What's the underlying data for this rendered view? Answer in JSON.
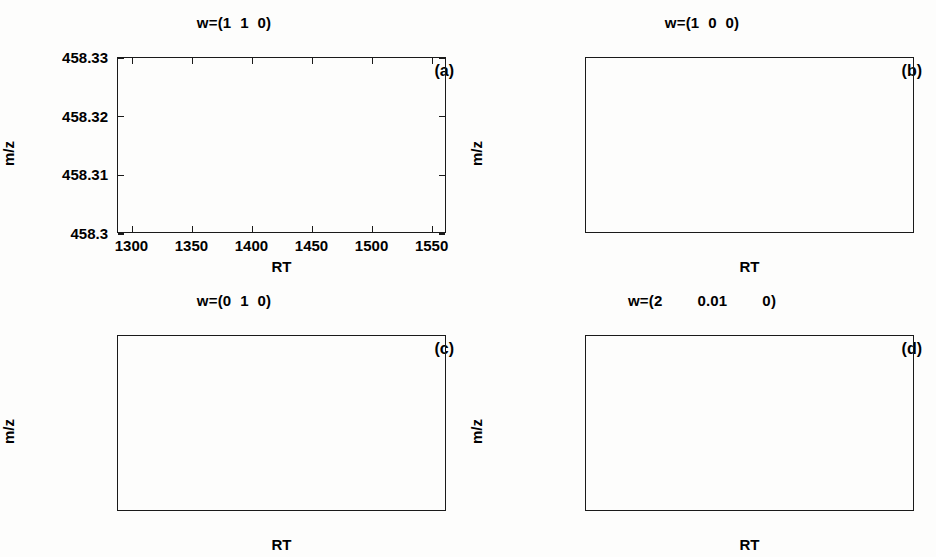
{
  "figure": {
    "background": "#fdfdfc",
    "ink": "#1a1a1a",
    "panel_count": 4
  },
  "panels": [
    {
      "id": "a",
      "letter": "(a)",
      "title": "w=(1  1  0)",
      "xlabel": "RT",
      "ylabel": "m/z"
    },
    {
      "id": "b",
      "letter": "(b)",
      "title": "w=(1  0  0)",
      "xlabel": "RT",
      "ylabel": "m/z"
    },
    {
      "id": "c",
      "letter": "(c)",
      "title": "w=(0  1  0)",
      "xlabel": "RT",
      "ylabel": "m/z"
    },
    {
      "id": "d",
      "letter": "(d)",
      "title": "w=(2        0.01        0)",
      "xlabel": "RT",
      "ylabel": "m/z"
    }
  ],
  "axis": {
    "xticks": [
      1300,
      1350,
      1400,
      1450,
      1500,
      1550
    ],
    "xticklabels": [
      "1300",
      "1350",
      "1400",
      "1450",
      "1500",
      "1550"
    ],
    "yticks": [
      458.3,
      458.31,
      458.32,
      458.33
    ],
    "yticklabels": [
      "458.3",
      "458.31",
      "458.32",
      "458.33"
    ],
    "xlim": [
      1288,
      1562
    ],
    "ylim": [
      458.3,
      458.33
    ]
  },
  "chart_data": [
    {
      "type": "scatter",
      "panel": "a",
      "title": "w=(1  1  0)",
      "xlabel": "RT",
      "ylabel": "m/z",
      "xlim": [
        1288,
        1562
      ],
      "ylim": [
        458.3,
        458.33
      ],
      "xticks": [
        1300,
        1350,
        1400,
        1450,
        1500,
        1550
      ],
      "yticks": [
        458.3,
        458.31,
        458.32,
        458.33
      ],
      "grid": false,
      "legend": "none",
      "annotation": "(a)",
      "series": [
        {
          "name": "cluster-left-diamond",
          "marker": "diamond",
          "filled": false,
          "n": 210,
          "x_range": [
            1316,
            1376
          ],
          "y_range": [
            458.3095,
            458.3205
          ],
          "x_center": 1346,
          "y_center": 458.315
        },
        {
          "name": "cluster-right-asterisk",
          "marker": "asterisk",
          "filled": true,
          "n": 22,
          "x_range": [
            1468,
            1486
          ],
          "y_range": [
            458.3105,
            458.3222
          ],
          "x_center": 1477,
          "y_center": 458.3155
        },
        {
          "name": "cluster-right-triangle-left",
          "marker": "triangle-left",
          "filled": false,
          "n": 560,
          "x_range": [
            1480,
            1558
          ],
          "y_range": [
            458.3088,
            458.3208
          ],
          "x_center": 1520,
          "y_center": 458.315
        }
      ]
    },
    {
      "type": "scatter",
      "panel": "b",
      "title": "w=(1  0  0)",
      "xlabel": "RT",
      "ylabel": "m/z",
      "xlim": [
        1288,
        1562
      ],
      "ylim": [
        458.3,
        458.33
      ],
      "xticks": [
        1300,
        1350,
        1400,
        1450,
        1500,
        1550
      ],
      "yticks": [
        458.3,
        458.31,
        458.32,
        458.33
      ],
      "grid": false,
      "legend": "none",
      "annotation": "(b)",
      "series": [
        {
          "name": "cluster-left-triangle-left",
          "marker": "triangle-left",
          "filled": false,
          "n": 215,
          "x_range": [
            1316,
            1376
          ],
          "y_range": [
            458.3095,
            458.3208
          ],
          "x_center": 1346,
          "y_center": 458.315
        },
        {
          "name": "cluster-right-triangle-left",
          "marker": "triangle-left",
          "filled": false,
          "n": 580,
          "x_range": [
            1466,
            1558
          ],
          "y_range": [
            458.3088,
            458.3222
          ],
          "x_center": 1516,
          "y_center": 458.315
        }
      ]
    },
    {
      "type": "scatter",
      "panel": "c",
      "title": "w=(0  1  0)",
      "xlabel": "RT",
      "ylabel": "m/z",
      "xlim": [
        1288,
        1562
      ],
      "ylim": [
        458.3,
        458.33
      ],
      "xticks": [
        1300,
        1350,
        1400,
        1450,
        1500,
        1550
      ],
      "yticks": [
        458.3,
        458.31,
        458.32,
        458.33
      ],
      "grid": false,
      "legend": "none",
      "annotation": "(c)",
      "series": [
        {
          "name": "cluster-left-square",
          "marker": "square",
          "filled": false,
          "n": 60,
          "x_range": [
            1322,
            1356
          ],
          "y_range": [
            458.3098,
            458.3205
          ],
          "x_center": 1338,
          "y_center": 458.315
        },
        {
          "name": "cluster-left-triangle-left",
          "marker": "triangle-left",
          "filled": false,
          "n": 95,
          "x_range": [
            1316,
            1376
          ],
          "y_range": [
            458.3098,
            458.3202
          ],
          "x_center": 1344,
          "y_center": 458.315
        },
        {
          "name": "cluster-left-pentagram",
          "marker": "pentagram",
          "filled": true,
          "n": 80,
          "x_range": [
            1330,
            1372
          ],
          "y_range": [
            458.3098,
            458.3205
          ],
          "x_center": 1354,
          "y_center": 458.315
        },
        {
          "name": "cluster-right-asterisk",
          "marker": "asterisk",
          "filled": true,
          "n": 24,
          "x_range": [
            1470,
            1486
          ],
          "y_range": [
            458.31,
            458.3222
          ],
          "x_center": 1478,
          "y_center": 458.3155
        },
        {
          "name": "cluster-right-triangle-left",
          "marker": "triangle-left",
          "filled": false,
          "n": 200,
          "x_range": [
            1466,
            1556
          ],
          "y_range": [
            458.3082,
            458.3205
          ],
          "x_center": 1512,
          "y_center": 458.315
        },
        {
          "name": "cluster-right-pentagram",
          "marker": "pentagram",
          "filled": true,
          "n": 330,
          "x_range": [
            1480,
            1558
          ],
          "y_range": [
            458.309,
            458.321
          ],
          "x_center": 1520,
          "y_center": 458.3152
        }
      ]
    },
    {
      "type": "scatter",
      "panel": "d",
      "title": "w=(2        0.01        0)",
      "xlabel": "RT",
      "ylabel": "m/z",
      "xlim": [
        1288,
        1562
      ],
      "ylim": [
        458.3,
        458.33
      ],
      "xticks": [
        1300,
        1350,
        1400,
        1450,
        1500,
        1550
      ],
      "yticks": [
        458.3,
        458.31,
        458.32,
        458.33
      ],
      "grid": false,
      "legend": "none",
      "annotation": "(d)",
      "series": [
        {
          "name": "cluster-left-pentagram",
          "marker": "pentagram",
          "filled": true,
          "n": 190,
          "x_range": [
            1316,
            1374
          ],
          "y_range": [
            458.3098,
            458.3212
          ],
          "x_center": 1345,
          "y_center": 458.3152
        },
        {
          "name": "cluster-right-triangle-down",
          "marker": "triangle-down",
          "filled": false,
          "n": 620,
          "x_range": [
            1468,
            1558
          ],
          "y_range": [
            458.3088,
            458.3218
          ],
          "x_center": 1516,
          "y_center": 458.3152
        }
      ]
    }
  ]
}
